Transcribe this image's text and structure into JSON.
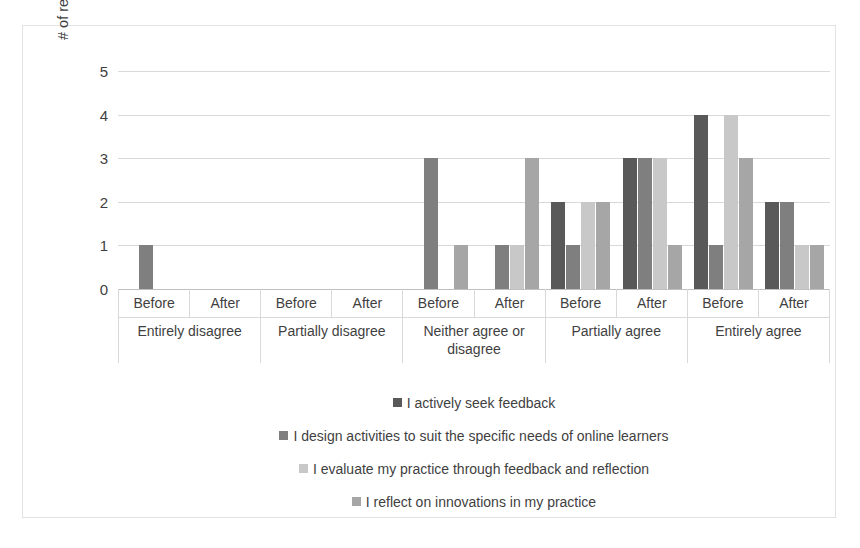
{
  "chart_data": {
    "type": "bar",
    "title": "",
    "subtitle": "",
    "xlabel": "",
    "ylabel": "# of respondents",
    "ylim": [
      0,
      5
    ],
    "yticks": [
      "0",
      "1",
      "2",
      "3",
      "4",
      "5"
    ],
    "grid": true,
    "legend_position": "bottom",
    "grouping": "grouped",
    "categories": [
      "Entirely disagree",
      "Partially disagree",
      "Neither agree or disagree",
      "Partially agree",
      "Entirely agree"
    ],
    "subcategories": [
      "Before",
      "After"
    ],
    "series": [
      {
        "name": "I actively seek feedback",
        "color": "#595959",
        "values": {
          "Entirely disagree": {
            "Before": 0,
            "After": 0
          },
          "Partially disagree": {
            "Before": 0,
            "After": 0
          },
          "Neither agree or disagree": {
            "Before": 0,
            "After": 0
          },
          "Partially agree": {
            "Before": 2,
            "After": 3
          },
          "Entirely agree": {
            "Before": 4,
            "After": 2
          }
        }
      },
      {
        "name": "I design activities to suit the specific needs of online learners",
        "color": "#7f7f7f",
        "values": {
          "Entirely disagree": {
            "Before": 1,
            "After": 0
          },
          "Partially disagree": {
            "Before": 0,
            "After": 0
          },
          "Neither agree or disagree": {
            "Before": 3,
            "After": 1
          },
          "Partially agree": {
            "Before": 1,
            "After": 3
          },
          "Entirely agree": {
            "Before": 1,
            "After": 2
          }
        }
      },
      {
        "name": "I evaluate my practice through feedback and reflection",
        "color": "#c8c8c8",
        "values": {
          "Entirely disagree": {
            "Before": 0,
            "After": 0
          },
          "Partially disagree": {
            "Before": 0,
            "After": 0
          },
          "Neither agree or disagree": {
            "Before": 0,
            "After": 1
          },
          "Partially agree": {
            "Before": 2,
            "After": 3
          },
          "Entirely agree": {
            "Before": 4,
            "After": 1
          }
        }
      },
      {
        "name": "I reflect on innovations in my practice",
        "color": "#a6a6a6",
        "values": {
          "Entirely disagree": {
            "Before": 0,
            "After": 0
          },
          "Partially disagree": {
            "Before": 0,
            "After": 0
          },
          "Neither agree or disagree": {
            "Before": 1,
            "After": 3
          },
          "Partially agree": {
            "Before": 2,
            "After": 1
          },
          "Entirely agree": {
            "Before": 3,
            "After": 1
          }
        }
      }
    ]
  }
}
